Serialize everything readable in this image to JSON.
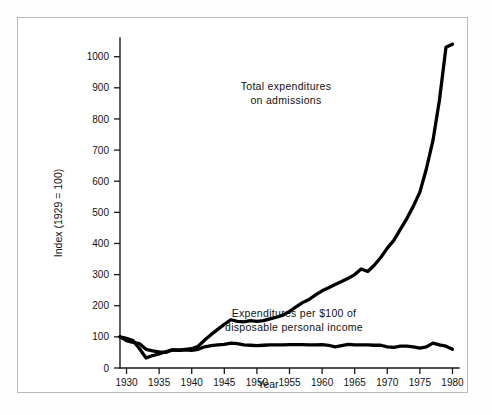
{
  "figure": {
    "background_color": "#ffffff",
    "frame_border_color": "#b9b9b9",
    "line_color": "#000000",
    "text_color": "#111111"
  },
  "axes": {
    "y_title": "Index (1929 = 100)",
    "x_title": "Year",
    "y_ticks": [
      "0",
      "100",
      "200",
      "300",
      "400",
      "500",
      "600",
      "700",
      "800",
      "900",
      "1000"
    ],
    "x_ticks": [
      "1930",
      "1935",
      "1940",
      "1945",
      "1950",
      "1955",
      "1960",
      "1965",
      "1970",
      "1975",
      "1980"
    ]
  },
  "annotations": {
    "total_line_1": "Total expenditures",
    "total_line_2": "on admissions",
    "share_line_1": "Expenditures per $100 of",
    "share_line_2": "disposable personal income"
  },
  "chart_data": {
    "type": "line",
    "title": "",
    "xlabel": "Year",
    "ylabel": "Index (1929 = 100)",
    "xlim": [
      1929,
      1981
    ],
    "ylim": [
      0,
      1060
    ],
    "grid": false,
    "legend": "annotated inline",
    "yticks": [
      0,
      100,
      200,
      300,
      400,
      500,
      600,
      700,
      800,
      900,
      1000
    ],
    "xticks": [
      1930,
      1935,
      1940,
      1945,
      1950,
      1955,
      1960,
      1965,
      1970,
      1975,
      1980
    ],
    "x": [
      1929,
      1930,
      1931,
      1932,
      1933,
      1934,
      1935,
      1936,
      1937,
      1938,
      1939,
      1940,
      1941,
      1942,
      1943,
      1944,
      1945,
      1946,
      1947,
      1948,
      1949,
      1950,
      1951,
      1952,
      1953,
      1954,
      1955,
      1956,
      1957,
      1958,
      1959,
      1960,
      1961,
      1962,
      1963,
      1964,
      1965,
      1966,
      1967,
      1968,
      1969,
      1970,
      1971,
      1972,
      1973,
      1974,
      1975,
      1976,
      1977,
      1978,
      1979,
      1980
    ],
    "series": [
      {
        "name": "Total expenditures on admissions",
        "annotation": "Total expenditures on admissions",
        "values": [
          100,
          95,
          88,
          62,
          32,
          40,
          45,
          52,
          58,
          57,
          60,
          62,
          70,
          90,
          108,
          124,
          140,
          155,
          150,
          148,
          152,
          150,
          152,
          158,
          163,
          170,
          182,
          196,
          210,
          220,
          235,
          248,
          258,
          268,
          278,
          288,
          300,
          318,
          310,
          330,
          355,
          385,
          410,
          445,
          480,
          520,
          565,
          640,
          730,
          860,
          1030,
          1040
        ]
      },
      {
        "name": "Expenditures per $100 of disposable personal income",
        "annotation": "Expenditures per $100 of disposable personal income",
        "values": [
          100,
          88,
          82,
          78,
          60,
          55,
          52,
          50,
          58,
          57,
          58,
          57,
          60,
          68,
          72,
          74,
          76,
          80,
          78,
          74,
          73,
          72,
          73,
          74,
          74,
          74,
          75,
          75,
          75,
          74,
          74,
          75,
          73,
          68,
          72,
          76,
          74,
          74,
          74,
          73,
          73,
          68,
          66,
          70,
          70,
          68,
          64,
          68,
          80,
          74,
          70,
          60
        ]
      }
    ]
  }
}
